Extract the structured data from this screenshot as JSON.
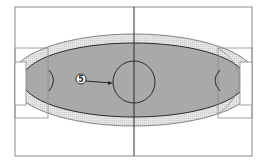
{
  "diagram": {
    "title": "",
    "callouts": [
      {
        "label": "5",
        "target": "center-circle"
      }
    ],
    "colors": {
      "background": "#ffffff",
      "frame_line": "#8a8a8a",
      "ink_line": "#2a2a2a",
      "inner_fill": "#a9a9a9",
      "band_fill": "#e2e2e2",
      "white_fill": "#ffffff"
    }
  }
}
